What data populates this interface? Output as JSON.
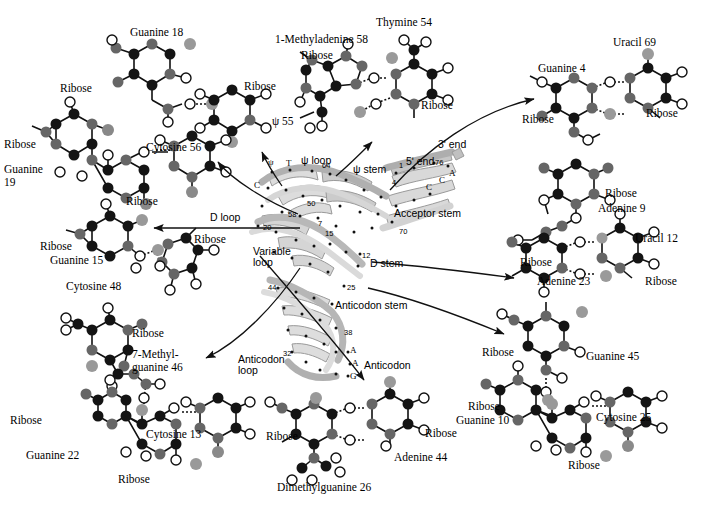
{
  "figure": {
    "background_color": "#ffffff",
    "atom_colors": {
      "carbon_dark": "#141414",
      "nitrogen_mid": "#666666",
      "oxygen_open": "#ffffff",
      "phosphorus_light": "#a8a8a8",
      "ribbon_light": "#dcdcdc",
      "ribbon_mid": "#b4b4b4",
      "bond_stroke": "#111111"
    },
    "bottom_caption": ""
  },
  "structure": {
    "name": "tRNA-ribbon-model",
    "region_labels": [
      {
        "id": "psi-loop",
        "text": "ψ loop",
        "x": 301,
        "y": 161
      },
      {
        "id": "psi-stem",
        "text": "ψ stem",
        "x": 353,
        "y": 170
      },
      {
        "id": "acceptor-stem",
        "text": "Acceptor stem",
        "x": 420,
        "y": 214
      },
      {
        "id": "d-loop",
        "text": "D loop",
        "x": 216,
        "y": 218
      },
      {
        "id": "d-stem",
        "text": "D stem",
        "x": 373,
        "y": 263
      },
      {
        "id": "variable-loop-1",
        "text": "Variable",
        "x": 255,
        "y": 252
      },
      {
        "id": "variable-loop-2",
        "text": "loop",
        "x": 255,
        "y": 263
      },
      {
        "id": "anticodon-stem",
        "text": "Anticodon stem",
        "x": 337,
        "y": 305
      },
      {
        "id": "anticodon-loop-1",
        "text": "Anticodon",
        "x": 243,
        "y": 359
      },
      {
        "id": "anticodon-loop-2",
        "text": "loop",
        "x": 243,
        "y": 370
      },
      {
        "id": "anticodon",
        "text": "Anticodon",
        "x": 367,
        "y": 365
      },
      {
        "id": "five-prime-end",
        "text": "5ʹ end",
        "x": 411,
        "y": 162
      },
      {
        "id": "three-prime-end",
        "text": "3ʹ end",
        "x": 448,
        "y": 145
      }
    ],
    "residue_numbers": [
      {
        "id": "num-64",
        "text": "64",
        "x": 322,
        "y": 162
      },
      {
        "id": "num-4",
        "text": "4",
        "x": 392,
        "y": 180
      },
      {
        "id": "num-1",
        "text": "1",
        "x": 399,
        "y": 163
      },
      {
        "id": "num-76",
        "text": "76",
        "x": 437,
        "y": 160
      },
      {
        "id": "num-50",
        "text": "50",
        "x": 309,
        "y": 201
      },
      {
        "id": "num-58",
        "text": "58",
        "x": 290,
        "y": 212
      },
      {
        "id": "num-20",
        "text": "20",
        "x": 265,
        "y": 225
      },
      {
        "id": "num-7",
        "text": "7",
        "x": 319,
        "y": 221
      },
      {
        "id": "num-15",
        "text": "15",
        "x": 327,
        "y": 230
      },
      {
        "id": "num-70",
        "text": "70",
        "x": 401,
        "y": 229
      },
      {
        "id": "num-12",
        "text": "12",
        "x": 363,
        "y": 253
      },
      {
        "id": "num-44",
        "text": "44",
        "x": 270,
        "y": 285
      },
      {
        "id": "num-25",
        "text": "25",
        "x": 348,
        "y": 285
      },
      {
        "id": "num-38",
        "text": "38",
        "x": 345,
        "y": 330
      },
      {
        "id": "num-32",
        "text": "32",
        "x": 285,
        "y": 351
      }
    ],
    "base_letters": [
      {
        "id": "base-psi",
        "text": "ψ",
        "x": 271,
        "y": 162
      },
      {
        "id": "base-T",
        "text": "T",
        "x": 288,
        "y": 163
      },
      {
        "id": "base-C-1",
        "text": "C",
        "x": 257,
        "y": 184
      },
      {
        "id": "base-C-2",
        "text": "C",
        "x": 428,
        "y": 186
      },
      {
        "id": "base-C-3",
        "text": "C",
        "x": 441,
        "y": 180
      },
      {
        "id": "base-A-1",
        "text": "A",
        "x": 451,
        "y": 172
      },
      {
        "id": "base-A-2",
        "text": "A",
        "x": 352,
        "y": 349
      },
      {
        "id": "base-A-3",
        "text": "A",
        "x": 354,
        "y": 362
      },
      {
        "id": "base-G-1",
        "text": "G",
        "x": 352,
        "y": 375
      }
    ]
  },
  "molecules": [
    {
      "id": "guanine-18-psi-55",
      "name": "guanine18-pseudouridine55-pair",
      "labels": [
        {
          "id": "guanine-18",
          "text": "Guanine 18",
          "x": 130,
          "y": 32,
          "anchor": "left"
        },
        {
          "id": "ribose-g18",
          "text": "Ribose",
          "x": 60,
          "y": 88,
          "anchor": "left"
        },
        {
          "id": "ribose-p55",
          "text": "Ribose",
          "x": 246,
          "y": 85,
          "anchor": "left"
        },
        {
          "id": "psi-55",
          "text": "ψ 55",
          "x": 267,
          "y": 120,
          "anchor": "left"
        }
      ]
    },
    {
      "id": "guanine-19-cytosine-56",
      "name": "guanine19-cytosine56-pair",
      "labels": [
        {
          "id": "ribose-g19",
          "text": "Ribose",
          "x": 6,
          "y": 144,
          "anchor": "left"
        },
        {
          "id": "guanine-19a",
          "text": "Guanine",
          "x": 6,
          "y": 168,
          "anchor": "left"
        },
        {
          "id": "guanine-19b",
          "text": "19",
          "x": 6,
          "y": 181,
          "anchor": "left"
        },
        {
          "id": "cytosine-56",
          "text": "Cytosine 56",
          "x": 148,
          "y": 146,
          "anchor": "left"
        },
        {
          "id": "ribose-c56",
          "text": "Ribose",
          "x": 128,
          "y": 199,
          "anchor": "left"
        }
      ]
    },
    {
      "id": "guanine-15-cytosine-48",
      "name": "guanine15-cytosine48-pair",
      "labels": [
        {
          "id": "ribose-g15",
          "text": "Ribose",
          "x": 50,
          "y": 245,
          "anchor": "left"
        },
        {
          "id": "guanine-15",
          "text": "Guanine 15",
          "x": 55,
          "y": 259,
          "anchor": "left"
        },
        {
          "id": "cytosine-48",
          "text": "Cytosine 48",
          "x": 70,
          "y": 285,
          "anchor": "left"
        },
        {
          "id": "ribose-c48",
          "text": "Ribose",
          "x": 196,
          "y": 238,
          "anchor": "left"
        }
      ]
    },
    {
      "id": "methylguanine-46-cytosine-13-guanine-22",
      "name": "methylguanine46-cytosine13-guanine22-triple",
      "labels": [
        {
          "id": "ribose-mg46",
          "text": "Ribose",
          "x": 134,
          "y": 332,
          "anchor": "left"
        },
        {
          "id": "methylguanine1",
          "text": "7-Methyl-",
          "x": 134,
          "y": 353,
          "anchor": "left"
        },
        {
          "id": "methylguanine2",
          "text": "guanine 46",
          "x": 134,
          "y": 366,
          "anchor": "left"
        },
        {
          "id": "ribose-g22-l",
          "text": "Ribose",
          "x": 12,
          "y": 420,
          "anchor": "left"
        },
        {
          "id": "cytosine-13",
          "text": "Cytosine 13",
          "x": 148,
          "y": 434,
          "anchor": "left"
        },
        {
          "id": "guanine-22",
          "text": "Guanine 22",
          "x": 28,
          "y": 455,
          "anchor": "left"
        },
        {
          "id": "ribose-g22-b",
          "text": "Ribose",
          "x": 120,
          "y": 479,
          "anchor": "left"
        }
      ]
    },
    {
      "id": "methyladenine-58-thymine-54",
      "name": "methyladenine58-thymine54-pair",
      "labels": [
        {
          "id": "thymine-54",
          "text": "Thymine 54",
          "x": 378,
          "y": 22,
          "anchor": "left"
        },
        {
          "id": "methyladenine58",
          "text": "1-Methyladenine 58",
          "x": 277,
          "y": 39,
          "anchor": "left"
        },
        {
          "id": "ribose-ma58",
          "text": "Ribose",
          "x": 303,
          "y": 55,
          "anchor": "left"
        },
        {
          "id": "ribose-t54",
          "text": "Ribose",
          "x": 423,
          "y": 105,
          "anchor": "left"
        }
      ]
    },
    {
      "id": "guanine-4-uracil-69",
      "name": "guanine4-uracil69-pair",
      "labels": [
        {
          "id": "uracil-69",
          "text": "Uracil 69",
          "x": 615,
          "y": 42,
          "anchor": "left"
        },
        {
          "id": "guanine-4",
          "text": "Guanine 4",
          "x": 540,
          "y": 68,
          "anchor": "left"
        },
        {
          "id": "ribose-g4",
          "text": "Ribose",
          "x": 524,
          "y": 119,
          "anchor": "left"
        },
        {
          "id": "ribose-u69",
          "text": "Ribose",
          "x": 648,
          "y": 113,
          "anchor": "left"
        }
      ]
    },
    {
      "id": "adenine-9-uracil-12-adenine-23",
      "name": "adenine9-uracil12-adenine23-triple",
      "labels": [
        {
          "id": "ribose-a9",
          "text": "Ribose",
          "x": 607,
          "y": 193,
          "anchor": "left"
        },
        {
          "id": "adenine-9",
          "text": "Adenine 9",
          "x": 600,
          "y": 208,
          "anchor": "left"
        },
        {
          "id": "uracil-12",
          "text": "Uracil 12",
          "x": 637,
          "y": 238,
          "anchor": "left"
        },
        {
          "id": "ribose-a23",
          "text": "Ribose",
          "x": 522,
          "y": 262,
          "anchor": "left"
        },
        {
          "id": "adenine-23",
          "text": "Adenine 23",
          "x": 539,
          "y": 281,
          "anchor": "left"
        },
        {
          "id": "ribose-u12",
          "text": "Ribose",
          "x": 647,
          "y": 281,
          "anchor": "left"
        }
      ]
    },
    {
      "id": "guanine-45-guanine-10-cytosine-25",
      "name": "guanine45-guanine10-cytosine25-triple",
      "labels": [
        {
          "id": "ribose-g45",
          "text": "Ribose",
          "x": 484,
          "y": 352,
          "anchor": "left"
        },
        {
          "id": "guanine-45",
          "text": "Guanine 45",
          "x": 588,
          "y": 356,
          "anchor": "left"
        },
        {
          "id": "ribose-g10",
          "text": "Ribose",
          "x": 470,
          "y": 406,
          "anchor": "left"
        },
        {
          "id": "guanine-10",
          "text": "Guanine 10",
          "x": 458,
          "y": 420,
          "anchor": "left"
        },
        {
          "id": "cytosine-25",
          "text": "Cytosine 25",
          "x": 598,
          "y": 417,
          "anchor": "left"
        },
        {
          "id": "ribose-c25",
          "text": "Ribose",
          "x": 570,
          "y": 465,
          "anchor": "left"
        }
      ]
    },
    {
      "id": "dimethylguanine-26-adenine-44",
      "name": "dimethylguanine26-adenine44-pair",
      "labels": [
        {
          "id": "ribose-dmg26",
          "text": "Ribose",
          "x": 268,
          "y": 436,
          "anchor": "left"
        },
        {
          "id": "ribose-a44",
          "text": "Ribose",
          "x": 427,
          "y": 433,
          "anchor": "left"
        },
        {
          "id": "adenine-44",
          "text": "Adenine 44",
          "x": 396,
          "y": 457,
          "anchor": "left"
        },
        {
          "id": "dmg-26",
          "text": "Dimethylguanine 26",
          "x": 279,
          "y": 487,
          "anchor": "left"
        }
      ]
    }
  ],
  "arrows": [
    {
      "id": "arrow-to-cytosine56",
      "from": "d-loop-region",
      "to": "guanine-19-cytosine-56"
    },
    {
      "id": "arrow-to-psi55",
      "from": "psi-loop",
      "to": "guanine-18-psi-55"
    },
    {
      "id": "arrow-to-psi-loop",
      "from": "structure",
      "to": "methyladenine-58-thymine-54"
    },
    {
      "id": "arrow-to-guanine15",
      "from": "d-loop",
      "to": "guanine-15-cytosine-48"
    },
    {
      "id": "arrow-to-guanine4",
      "from": "acceptor-stem",
      "to": "guanine-4-uracil-69"
    },
    {
      "id": "arrow-to-adenine9",
      "from": "d-stem",
      "to": "adenine-9-uracil-12-adenine-23"
    },
    {
      "id": "arrow-to-mguanine46",
      "from": "variable-loop",
      "to": "methylguanine-46-cytosine-13-guanine-22"
    },
    {
      "id": "arrow-to-dmg26",
      "from": "anticodon-loop",
      "to": "dimethylguanine-26-adenine-44"
    },
    {
      "id": "arrow-to-guanine45",
      "from": "anticodon-stem",
      "to": "guanine-45-guanine-10-cytosine-25"
    }
  ]
}
